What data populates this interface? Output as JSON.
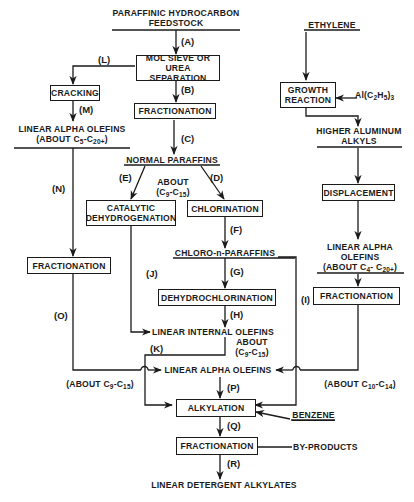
{
  "diagram": {
    "nodes": {
      "feedstock": "PARAFFINIC HYDROCARBON FEEDSTOCK",
      "feedstock_line1": "PARAFFINIC HYDROCARBON",
      "feedstock_line2": "FEEDSTOCK",
      "mol_sieve_line1": "MOL SIEVE  OR",
      "mol_sieve_line2": "UREA SEPARATION",
      "fractionation_1": "FRACTIONATION",
      "cracking": "CRACKING",
      "lao_cracking_line1": "LINEAR ALPHA OLEFINS",
      "lao_cracking_line2": "(ABOUT C5-C20+)",
      "normal_paraffins": "NORMAL PARAFFINS",
      "np_range_line1": "ABOUT",
      "np_range_line2": "(C9-C15)",
      "catalytic_line1": "CATALYTIC",
      "catalytic_line2": "DEHYDROGENATION",
      "chlorination": "CHLORINATION",
      "chloro_paraffins": "CHLORO-n-PARAFFINS",
      "dehydrochlorination": "DEHYDROCHLORINATION",
      "fractionation_left": "FRACTIONATION",
      "lio": "LINEAR INTERNAL OLEFINS",
      "lio_range_line1": "ABOUT",
      "lio_range_line2": "(C9-C15)",
      "left_range": "(ABOUT C9-C15)",
      "lao_main": "LINEAR ALPHA OLEFINS",
      "alkylation": "ALKYLATION",
      "benzene": "BENZENE",
      "fractionation_final": "FRACTIONATION",
      "by_products": "BY-PRODUCTS",
      "product": "LINEAR DETERGENT ALKYLATES",
      "ethylene": "ETHYLENE",
      "growth_line1": "GROWTH",
      "growth_line2": "REACTION",
      "triethylaluminum": "Al(C2H5)3",
      "higher_al_line1": "HIGHER ALUMINUM",
      "higher_al_line2": "ALKYLS",
      "displacement": "DISPLACEMENT",
      "lao_right_line1": "LINEAR ALPHA",
      "lao_right_line2": "OLEFINS",
      "lao_right_line3": "(ABOUT C4- C20+)",
      "fractionation_right": "FRACTIONATION",
      "right_range": "(ABOUT C10-C14)"
    },
    "steps": [
      "(A)",
      "(B)",
      "(C)",
      "(D)",
      "(E)",
      "(F)",
      "(G)",
      "(H)",
      "(I)",
      "(J)",
      "(K)",
      "(L)",
      "(M)",
      "(N)",
      "(O)",
      "(P)",
      "(Q)",
      "(R)"
    ],
    "line_color": "#1a1a1a",
    "background": "#ffffff"
  }
}
